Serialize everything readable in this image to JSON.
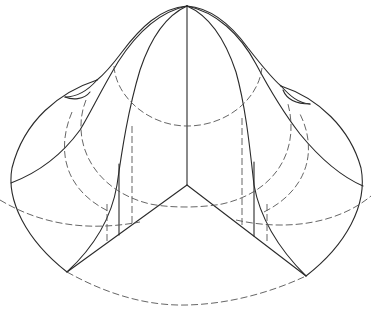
{
  "figure": {
    "title": "",
    "colors": {
      "background": "#ffffff",
      "line": "#2a2a2a",
      "hidden_line": "#555555"
    },
    "elements": {
      "apex": [
        187,
        6
      ],
      "center_vertex": [
        187,
        185
      ],
      "left_corner": [
        67,
        272
      ],
      "right_corner": [
        306,
        276
      ],
      "outline_left_extreme": [
        10,
        185
      ],
      "outline_right_extreme": [
        364,
        185
      ],
      "bottom_arc_lowest": [
        187,
        305
      ]
    }
  }
}
